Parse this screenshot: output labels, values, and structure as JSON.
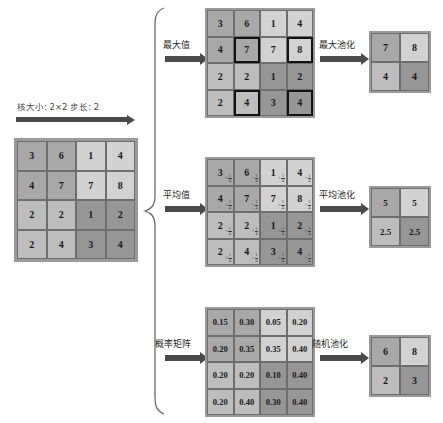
{
  "diagram": {
    "kernel_label": "核大小: 2×2 步长: 2",
    "input": {
      "name": "输入特征图",
      "rows": [
        [
          {
            "v": "3",
            "s": "s4"
          },
          {
            "v": "6",
            "s": "s4"
          },
          {
            "v": "1",
            "s": "s2"
          },
          {
            "v": "4",
            "s": "s2"
          }
        ],
        [
          {
            "v": "4",
            "s": "s4"
          },
          {
            "v": "7",
            "s": "s4"
          },
          {
            "v": "7",
            "s": "s2"
          },
          {
            "v": "8",
            "s": "s2"
          }
        ],
        [
          {
            "v": "2",
            "s": "s3"
          },
          {
            "v": "2",
            "s": "s3"
          },
          {
            "v": "1",
            "s": "s5"
          },
          {
            "v": "2",
            "s": "s5"
          }
        ],
        [
          {
            "v": "2",
            "s": "s3"
          },
          {
            "v": "4",
            "s": "s3"
          },
          {
            "v": "3",
            "s": "s5"
          },
          {
            "v": "4",
            "s": "s5"
          }
        ]
      ]
    },
    "branches": [
      {
        "id": "max",
        "in_label": "最大值",
        "out_label": "最大池化",
        "source": {
          "rows": [
            [
              {
                "v": "3",
                "s": "s4",
                "hl": false
              },
              {
                "v": "6",
                "s": "s4",
                "hl": false
              },
              {
                "v": "1",
                "s": "s2",
                "hl": false
              },
              {
                "v": "4",
                "s": "s2",
                "hl": false
              }
            ],
            [
              {
                "v": "4",
                "s": "s4",
                "hl": false
              },
              {
                "v": "7",
                "s": "s4",
                "hl": true
              },
              {
                "v": "7",
                "s": "s2",
                "hl": false
              },
              {
                "v": "8",
                "s": "s2",
                "hl": true
              }
            ],
            [
              {
                "v": "2",
                "s": "s3",
                "hl": false
              },
              {
                "v": "2",
                "s": "s3",
                "hl": false
              },
              {
                "v": "1",
                "s": "s5",
                "hl": false
              },
              {
                "v": "2",
                "s": "s5",
                "hl": false
              }
            ],
            [
              {
                "v": "2",
                "s": "s3",
                "hl": false
              },
              {
                "v": "4",
                "s": "s3",
                "hl": true
              },
              {
                "v": "3",
                "s": "s5",
                "hl": false
              },
              {
                "v": "4",
                "s": "s5",
                "hl": true
              }
            ]
          ]
        },
        "output": {
          "rows": [
            [
              {
                "v": "7",
                "s": "s4"
              },
              {
                "v": "8",
                "s": "s2"
              }
            ],
            [
              {
                "v": "4",
                "s": "s3"
              },
              {
                "v": "4",
                "s": "s5"
              }
            ]
          ]
        }
      },
      {
        "id": "avg",
        "in_label": "平均值",
        "out_label": "平均池化",
        "factor": "×1/4",
        "factor_numerator": "1",
        "factor_denominator": "4",
        "source": {
          "rows": [
            [
              {
                "v": "3",
                "s": "s4",
                "f": true
              },
              {
                "v": "6",
                "s": "s4",
                "f": true
              },
              {
                "v": "1",
                "s": "s2",
                "f": true
              },
              {
                "v": "4",
                "s": "s2",
                "f": true
              }
            ],
            [
              {
                "v": "4",
                "s": "s4",
                "f": true
              },
              {
                "v": "7",
                "s": "s4",
                "f": true
              },
              {
                "v": "7",
                "s": "s2",
                "f": true
              },
              {
                "v": "8",
                "s": "s2",
                "f": true
              }
            ],
            [
              {
                "v": "2",
                "s": "s3",
                "f": true
              },
              {
                "v": "2",
                "s": "s3",
                "f": true
              },
              {
                "v": "1",
                "s": "s5",
                "f": true
              },
              {
                "v": "2",
                "s": "s5",
                "f": true
              }
            ],
            [
              {
                "v": "2",
                "s": "s3",
                "f": true
              },
              {
                "v": "4",
                "s": "s3",
                "f": true
              },
              {
                "v": "3",
                "s": "s5",
                "f": true
              },
              {
                "v": "4",
                "s": "s5",
                "f": true
              }
            ]
          ]
        },
        "output": {
          "rows": [
            [
              {
                "v": "5",
                "s": "s4"
              },
              {
                "v": "5",
                "s": "s2"
              }
            ],
            [
              {
                "v": "2.5",
                "s": "s3"
              },
              {
                "v": "2.5",
                "s": "s5"
              }
            ]
          ]
        }
      },
      {
        "id": "prob",
        "in_label": "概率矩阵",
        "out_label": "随机池化",
        "source": {
          "rows": [
            [
              {
                "v": "0.15",
                "s": "s4"
              },
              {
                "v": "0.30",
                "s": "s4"
              },
              {
                "v": "0.05",
                "s": "s2"
              },
              {
                "v": "0.20",
                "s": "s2"
              }
            ],
            [
              {
                "v": "0.20",
                "s": "s4"
              },
              {
                "v": "0.35",
                "s": "s4"
              },
              {
                "v": "0.35",
                "s": "s2"
              },
              {
                "v": "0.40",
                "s": "s2"
              }
            ],
            [
              {
                "v": "0.20",
                "s": "s3"
              },
              {
                "v": "0.20",
                "s": "s3"
              },
              {
                "v": "0.10",
                "s": "s5"
              },
              {
                "v": "0.40",
                "s": "s5"
              }
            ],
            [
              {
                "v": "0.20",
                "s": "s3"
              },
              {
                "v": "0.40",
                "s": "s3"
              },
              {
                "v": "0.30",
                "s": "s5"
              },
              {
                "v": "0.40",
                "s": "s5"
              }
            ]
          ]
        },
        "output": {
          "rows": [
            [
              {
                "v": "6",
                "s": "s4"
              },
              {
                "v": "8",
                "s": "s2"
              }
            ],
            [
              {
                "v": "2",
                "s": "s3"
              },
              {
                "v": "3",
                "s": "s5"
              }
            ]
          ]
        }
      }
    ],
    "colors": {
      "arrow": "#4a4a4a",
      "matrix_frame": "#9a9a9a",
      "highlight_border": "#111111",
      "text": "#1a1a1a"
    }
  }
}
